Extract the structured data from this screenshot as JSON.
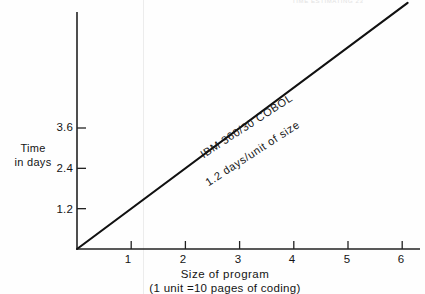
{
  "figure": {
    "header_fragment": "TIME ESTIMATING      23",
    "background_color": "#fefefe",
    "line_color": "#111111",
    "axis_color": "#222222"
  },
  "chart_data": {
    "type": "line",
    "title": "",
    "subtitle": "",
    "xlabel": "Size of program",
    "xlabel_note": "(1 unit =10 pages of coding)",
    "ylabel": "Time\nin days",
    "ylabel_line1": "Time",
    "ylabel_line2": "in days",
    "xlim": [
      0,
      6.3
    ],
    "ylim": [
      0,
      7.4
    ],
    "xticks": [
      1,
      2,
      3,
      4,
      5,
      6
    ],
    "xtick_labels": [
      "1",
      "2",
      "3",
      "4",
      "5",
      "6"
    ],
    "yticks": [
      1.2,
      2.4,
      3.6
    ],
    "ytick_labels": [
      "1.2",
      "2.4",
      "3.6"
    ],
    "grid": false,
    "legend_position": "inline-annotation",
    "series": [
      {
        "name": "IBM 360/30 COBOL",
        "slope_label": "1.2 days/unit of size",
        "slope": 1.2,
        "intercept": 0,
        "x": [
          0,
          6.1
        ],
        "y": [
          0,
          7.32
        ]
      }
    ],
    "annotations": [
      {
        "text": "IBM 360/30 COBOL",
        "rotation_deg": -33
      },
      {
        "text": "1.2 days/unit of size",
        "rotation_deg": -33
      }
    ]
  }
}
